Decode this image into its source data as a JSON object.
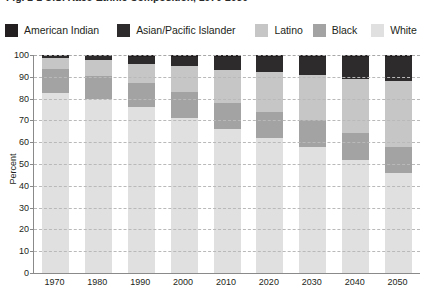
{
  "title": "Fig. 1-1  U.S. Race-Ethnic Composition, 1970-2050",
  "legend": {
    "items": [
      {
        "label": "American Indian",
        "color": "#231f20",
        "name": "american-indian"
      },
      {
        "label": "Asian/Pacific Islander",
        "color": "#2e2b2c",
        "name": "asian-pacific-islander"
      },
      {
        "label": "Latino",
        "color": "#c6c6c6",
        "name": "latino"
      },
      {
        "label": "Black",
        "color": "#a3a3a3",
        "name": "black"
      },
      {
        "label": "White",
        "color": "#e0e0e0",
        "name": "white"
      }
    ]
  },
  "axes": {
    "ylabel": "Percent",
    "yticks": [
      "0",
      "10",
      "20",
      "30",
      "40",
      "50",
      "60",
      "70",
      "80",
      "90",
      "100"
    ],
    "xticks": [
      "1970",
      "1980",
      "1990",
      "2000",
      "2010",
      "2020",
      "2030",
      "2040",
      "2050"
    ]
  },
  "chart_data": {
    "type": "bar",
    "stacked": true,
    "title": "Fig. 1-1  U.S. Race-Ethnic Composition, 1970-2050",
    "xlabel": "",
    "ylabel": "Percent",
    "ylim": [
      0,
      100
    ],
    "yticks": [
      0,
      10,
      20,
      30,
      40,
      50,
      60,
      70,
      80,
      90,
      100
    ],
    "grid": true,
    "legend_position": "top",
    "categories": [
      "1970",
      "1980",
      "1990",
      "2000",
      "2010",
      "2020",
      "2030",
      "2040",
      "2050"
    ],
    "series": [
      {
        "name": "White",
        "color": "#e0e0e0",
        "values": [
          83,
          80,
          76,
          71,
          66,
          62,
          58,
          52,
          46
        ]
      },
      {
        "name": "Black",
        "color": "#a3a3a3",
        "values": [
          11,
          11,
          11,
          12,
          12,
          12,
          12,
          12,
          12
        ]
      },
      {
        "name": "Latino",
        "color": "#c6c6c6",
        "values": [
          5,
          7,
          9,
          12,
          15,
          18,
          21,
          25,
          30
        ]
      },
      {
        "name": "Asian/Pacific Islander",
        "color": "#2e2b2c",
        "values": [
          1,
          2,
          3,
          4,
          6,
          7,
          8,
          10,
          11
        ]
      },
      {
        "name": "American Indian",
        "color": "#231f20",
        "values": [
          0.5,
          0.5,
          1,
          1,
          1,
          1,
          1,
          1,
          1
        ]
      }
    ]
  }
}
